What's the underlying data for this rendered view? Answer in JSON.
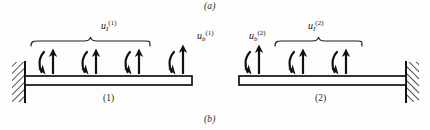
{
  "figure": {
    "part_labels": [
      {
        "id": "a",
        "text": "(a)"
      },
      {
        "id": "b",
        "text": "(b)"
      }
    ],
    "caption_colors": {
      "ink": "#141414",
      "background": "#fdfdfd",
      "hatch": "#1a1a1a"
    }
  },
  "substructures": [
    {
      "name": "substructure-1",
      "label": "(1)",
      "support_side": "left",
      "interface_label": {
        "base": "u",
        "sub": "I",
        "sup": "(1)"
      },
      "boundary_label": {
        "base": "u",
        "sub": "b",
        "sup": "(1)"
      },
      "interface_dof_count": 3,
      "boundary_dof_count": 1
    },
    {
      "name": "substructure-2",
      "label": "(2)",
      "support_side": "right",
      "interface_label": {
        "base": "u",
        "sub": "I",
        "sup": "(2)"
      },
      "boundary_label": {
        "base": "u",
        "sub": "b",
        "sup": "(2)"
      },
      "interface_dof_count": 2,
      "boundary_dof_count": 1
    }
  ],
  "labels": {
    "part_a": "(a)",
    "part_b": "(b)",
    "beam_1": "(1)",
    "beam_2": "(2)",
    "uI1_base": "u",
    "uI1_sub": "I",
    "uI1_sup": "(1)",
    "ub1_base": "u",
    "ub1_sub": "b",
    "ub1_sup": "(1)",
    "ub2_base": "u",
    "ub2_sub": "b",
    "ub2_sup": "(2)",
    "uI2_base": "u",
    "uI2_sub": "I",
    "uI2_sup": "(2)"
  },
  "geometry": {
    "beam_1": {
      "x": 25,
      "y": 76,
      "width": 167,
      "height": 9
    },
    "beam_2": {
      "x": 239,
      "y": 76,
      "width": 167,
      "height": 9
    },
    "wall_left": {
      "x": 12,
      "y": 62,
      "width": 13,
      "height": 40
    },
    "wall_right": {
      "x": 406,
      "y": 62,
      "width": 13,
      "height": 40
    },
    "dof_arrows_beam_1_x": [
      47,
      90,
      133,
      177
    ],
    "dof_arrows_beam_2_x": [
      253,
      297,
      340
    ],
    "brace_1": {
      "x1": 31,
      "x2": 150,
      "y": 41
    },
    "brace_2": {
      "x1": 275,
      "x2": 362,
      "y": 41
    }
  }
}
